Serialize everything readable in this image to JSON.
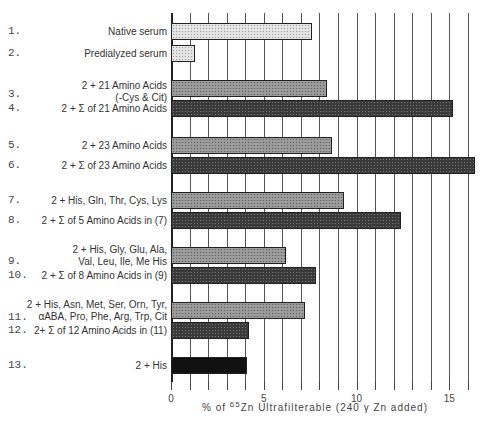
{
  "chart_data": {
    "type": "bar",
    "orientation": "horizontal",
    "title": "",
    "xlabel": "% of 65Zn Ultrafilterable (240 γ Zn added)",
    "xlabel_parts": {
      "prefix": "% of ",
      "superscript": "65",
      "suffix": "Zn Ultrafilterable (240 γ Zn added)"
    },
    "ylabel": "",
    "xlim": [
      0,
      16
    ],
    "xticks": [
      0,
      5,
      10,
      15
    ],
    "grid": "vertical lines every 1 unit",
    "legend": null,
    "categories": [
      {
        "num": "1.",
        "label": [
          "Native serum"
        ]
      },
      {
        "num": "2.",
        "label": [
          "Predialyzed serum"
        ]
      },
      {
        "num": "3.",
        "label": [
          "2 + 21 Amino Acids",
          "(-Cys & Cit)"
        ]
      },
      {
        "num": "4.",
        "label": [
          "2 + Σ of 21 Amino Acids"
        ]
      },
      {
        "num": "5.",
        "label": [
          "2 + 23 Amino Acids"
        ]
      },
      {
        "num": "6.",
        "label": [
          "2 + Σ of 23 Amino Acids"
        ]
      },
      {
        "num": "7.",
        "label": [
          "2 + His, Gln, Thr, Cys, Lys"
        ]
      },
      {
        "num": "8.",
        "label": [
          "2 + Σ of 5 Amino Acids in (7)"
        ]
      },
      {
        "num": "9.",
        "label": [
          "2 + His, Gly, Glu, Ala,",
          "Val, Leu, Ile, Me His"
        ]
      },
      {
        "num": "10.",
        "label": [
          "2 + Σ of 8 Amino Acids in (9)"
        ]
      },
      {
        "num": "11.",
        "label": [
          "2 + His, Asn, Met, Ser, Orn, Tyr,",
          "αABA, Pro, Phe, Arg, Trp, Cit"
        ]
      },
      {
        "num": "12.",
        "label": [
          "2+ Σ of 12 Amino Acids in (11)"
        ]
      },
      {
        "num": "13.",
        "label": [
          "2 + His"
        ]
      }
    ],
    "values": [
      7.6,
      1.3,
      8.4,
      15.2,
      8.7,
      16.4,
      9.3,
      12.4,
      6.2,
      7.8,
      7.2,
      4.2,
      4.1
    ],
    "patterns": [
      "light",
      "light",
      "mid",
      "dark",
      "mid",
      "dark",
      "mid",
      "dark",
      "mid",
      "dark",
      "mid",
      "dark",
      "solid"
    ],
    "bar_tops_px": [
      23,
      45,
      80,
      100,
      137,
      157,
      192,
      212,
      247,
      267,
      302,
      322,
      357
    ],
    "row_label_tops_px": [
      [
        26
      ],
      [
        48
      ],
      [
        80,
        92
      ],
      [
        103
      ],
      [
        140
      ],
      [
        160
      ],
      [
        195
      ],
      [
        215
      ],
      [
        244,
        256
      ],
      [
        270
      ],
      [
        299,
        311
      ],
      [
        325
      ],
      [
        360
      ]
    ],
    "row_num_tops_px": [
      25,
      47,
      88,
      102,
      139,
      159,
      194,
      214,
      255,
      269,
      311,
      324,
      359
    ]
  }
}
